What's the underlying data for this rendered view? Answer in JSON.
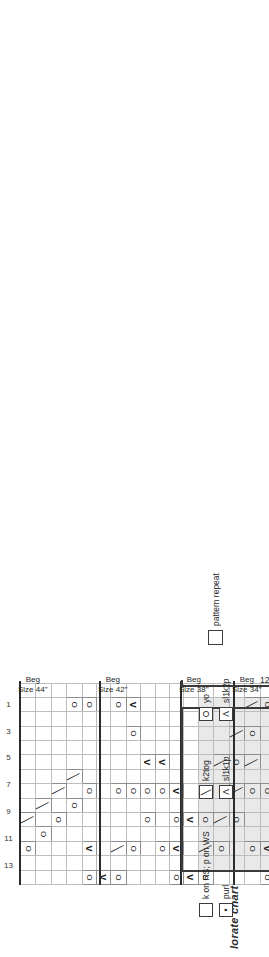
{
  "title": "lorate chart A",
  "chart_data": {
    "type": "table",
    "title": "lorate chart A",
    "stitch_columns": 14,
    "rows": 60,
    "column_numbers_top": [
      13,
      11,
      9,
      7,
      5,
      3,
      1
    ],
    "column_numbers_bottom": [
      14,
      12,
      10,
      8,
      6,
      4,
      2
    ],
    "repeat_label": "12 st repeat",
    "repeat_stitches": 12,
    "symbols": {
      "blank": "k on RS; p on WS",
      "O": "yo",
      "k2tog": "k2tog",
      "s1k1p": "sl1k1p",
      "s1k2p": "sl1k2p",
      "purl": "purl"
    },
    "grid": [
      "..O.k.........",
      "...O.k........",
      "....O.k.......",
      ".....O.k....O.",
      "O.A...O.....O.",
      "A.............",
      "O.k...O.....O.",
      "..O...O...O.A.",
      "....O.O.A.....",
      "..O...O.A.....",
      "O.A.O.A.......",
      "A...A.........",
      "O.k.O.k.......",
      "..O.k.O.k.....",
      "....O.k.O.k...",
      "..O...O.k.O.k.",
      "O.A...O.....O.",
      "A.............",
      "O.k...O.....O.",
      "..O...O...O.A.",
      "....O.O.A..O.A",
      "..O.A.O.A...O.",
      "O.A.O.A.......",
      "A...A.........",
      "O.k.O.k.......",
      "..O.k.O.k.....",
      "....O.k.O.k...",
      "..O...O.k.O.k.",
      "O.A...O.....O.",
      "A.............",
      "O.k...O.....O.",
      "..O...O...O.A.",
      "....O.O.A..O.A",
      "..O.A.O.A...O.",
      "O.A.O.A.......",
      "A...A.........",
      "O.k.O.k.......",
      "..O.k.O.k.....",
      "....O.k.O.k...",
      "..O...O.k.O.k.",
      "O.A...O.....O.",
      "A.............",
      "O.k...O.....O.",
      "..O...O...O.A.",
      "....O.O.A..O.A",
      "..O.A.O.A...O.",
      "O.A.O.A.......",
      "A...A.........",
      "O.k.O.k.......",
      "..O.k.O.k.....",
      "....O.k.O.k...",
      "..O...O.k.O.k.",
      "O.A...O.....O.",
      "A.............",
      "O.k...O.....O.",
      "..O...O...O.A.",
      "....O.O.A..O.A",
      "..O.A.O.A...O.",
      "O.A.O.A.....O.",
      "A...A.......A."
    ]
  },
  "markers": {
    "beg": [
      {
        "line1": "Beg",
        "line2": "Size 44\""
      },
      {
        "line1": "Beg",
        "line2": "Size 42\""
      },
      {
        "line1": "Beg",
        "line2": "Size 38\""
      },
      {
        "line1": "Beg",
        "line2": "Size 34\""
      },
      {
        "line1": "Beg",
        "line2": "Size 32\""
      }
    ],
    "end": [
      {
        "line1": "End",
        "line2": "Size 32\""
      },
      {
        "line1": "End",
        "line2": "Size 34\""
      },
      {
        "line1": "End",
        "line2": "Size 38\""
      },
      {
        "line1": "End",
        "line2": "Size 42\""
      },
      {
        "line1": "End",
        "line2": "Size 44\""
      }
    ]
  },
  "legend": {
    "items": [
      {
        "glyph": "",
        "label": "k on RS; p on WS"
      },
      {
        "glyph": "•",
        "label": "purl"
      },
      {
        "glyph": "╲",
        "label": "k2tog"
      },
      {
        "glyph": "Λ",
        "label": "sl1k1p"
      },
      {
        "glyph": "O",
        "label": "yo"
      },
      {
        "glyph": "Λ",
        "label": "sl1k2p"
      },
      {
        "glyph": "",
        "label": "pattern repeat"
      }
    ]
  }
}
